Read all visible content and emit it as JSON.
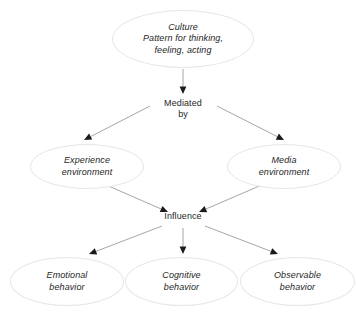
{
  "diagram": {
    "background_color": "#ffffff",
    "edge_line_color": "#a6a6a6",
    "arrowhead_color": "#1a1a1a",
    "ellipse_border_color": "#e6e6e6",
    "text_color": "#262626",
    "nodes": [
      {
        "id": "culture",
        "label": "Culture\nPattern for thinking,\nfeeling, acting",
        "shape": "ellipse",
        "style": "italic",
        "x": 112,
        "y": 10,
        "w": 142,
        "h": 58
      },
      {
        "id": "mediated_by",
        "label": "Mediated\nby",
        "shape": "none",
        "style": "plain",
        "x": 150,
        "y": 96,
        "w": 66,
        "h": 26
      },
      {
        "id": "experience_environment",
        "label": "Experience\nenvironment",
        "shape": "ellipse",
        "style": "italic",
        "x": 30,
        "y": 144,
        "w": 114,
        "h": 45
      },
      {
        "id": "media_environment",
        "label": "Media\nenvironment",
        "shape": "ellipse",
        "style": "italic",
        "x": 227,
        "y": 144,
        "w": 114,
        "h": 45
      },
      {
        "id": "influence",
        "label": "Influence",
        "shape": "none",
        "style": "plain",
        "x": 152,
        "y": 209,
        "w": 62,
        "h": 16
      },
      {
        "id": "emotional_behavior",
        "label": "Emotional\nbehavior",
        "shape": "ellipse",
        "style": "italic",
        "x": 10,
        "y": 257,
        "w": 114,
        "h": 49
      },
      {
        "id": "cognitive_behavior",
        "label": "Cognitive\nbehavior",
        "shape": "ellipse",
        "style": "italic",
        "x": 125,
        "y": 257,
        "w": 113,
        "h": 49
      },
      {
        "id": "observable_behavior",
        "label": "Observable\nbehavior",
        "shape": "ellipse",
        "style": "italic",
        "x": 240,
        "y": 257,
        "w": 115,
        "h": 49
      }
    ],
    "edges": [
      {
        "id": "culture-to-mediated",
        "from": "culture",
        "to": "mediated_by",
        "x1": 183,
        "y1": 69,
        "x2": 183,
        "y2": 94
      },
      {
        "id": "mediated-to-experience",
        "from": "mediated_by",
        "to": "experience_environment",
        "x1": 150,
        "y1": 106,
        "x2": 84,
        "y2": 140
      },
      {
        "id": "mediated-to-media",
        "from": "mediated_by",
        "to": "media_environment",
        "x1": 217,
        "y1": 106,
        "x2": 284,
        "y2": 140
      },
      {
        "id": "experience-to-influence",
        "from": "experience_environment",
        "to": "influence",
        "x1": 104,
        "y1": 184,
        "x2": 168,
        "y2": 212
      },
      {
        "id": "media-to-influence",
        "from": "media_environment",
        "to": "influence",
        "x1": 264,
        "y1": 184,
        "x2": 199,
        "y2": 212
      },
      {
        "id": "influence-to-emotional",
        "from": "influence",
        "to": "emotional_behavior",
        "x1": 162,
        "y1": 226,
        "x2": 89,
        "y2": 254
      },
      {
        "id": "influence-to-cognitive",
        "from": "influence",
        "to": "cognitive_behavior",
        "x1": 183,
        "y1": 228,
        "x2": 183,
        "y2": 254
      },
      {
        "id": "influence-to-observable",
        "from": "influence",
        "to": "observable_behavior",
        "x1": 205,
        "y1": 226,
        "x2": 278,
        "y2": 254
      }
    ]
  }
}
